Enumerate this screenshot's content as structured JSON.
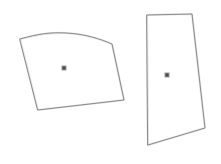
{
  "canvas": {
    "width": 221,
    "height": 164,
    "background_color": "#ffffff",
    "title": "Two hand-drawn polygon outlines with centroid markers"
  },
  "style": {
    "stroke_color": "#8a8a8a",
    "stroke_color_light": "#b5b5b5",
    "stroke_width": 1,
    "marker_outer_color": "#9a9a9a",
    "marker_inner_color": "#4a4a4a",
    "marker_size": 5,
    "marker_inner_size": 3
  },
  "shapes": [
    {
      "id": "shape-left",
      "name": "left-polygon",
      "type": "polygon",
      "vertex_count": 5,
      "points": "20,39 64,33 112,44 124,100 38,110",
      "path": "M 20 39 C 38 34 50 32 66 33 C 86 34 100 39 112 44 L 124 100 L 38 110 Z",
      "centroid": {
        "x": 64,
        "y": 68
      },
      "marker_label": "centroid-marker"
    },
    {
      "id": "shape-right",
      "name": "right-polygon",
      "type": "polygon",
      "vertex_count": 4,
      "points": "147,15 192,14 205,128 148,145",
      "path": "M 147 15 L 192 14 L 205 128 L 148 145 Z",
      "centroid": {
        "x": 167,
        "y": 75
      },
      "marker_label": "centroid-marker"
    }
  ]
}
